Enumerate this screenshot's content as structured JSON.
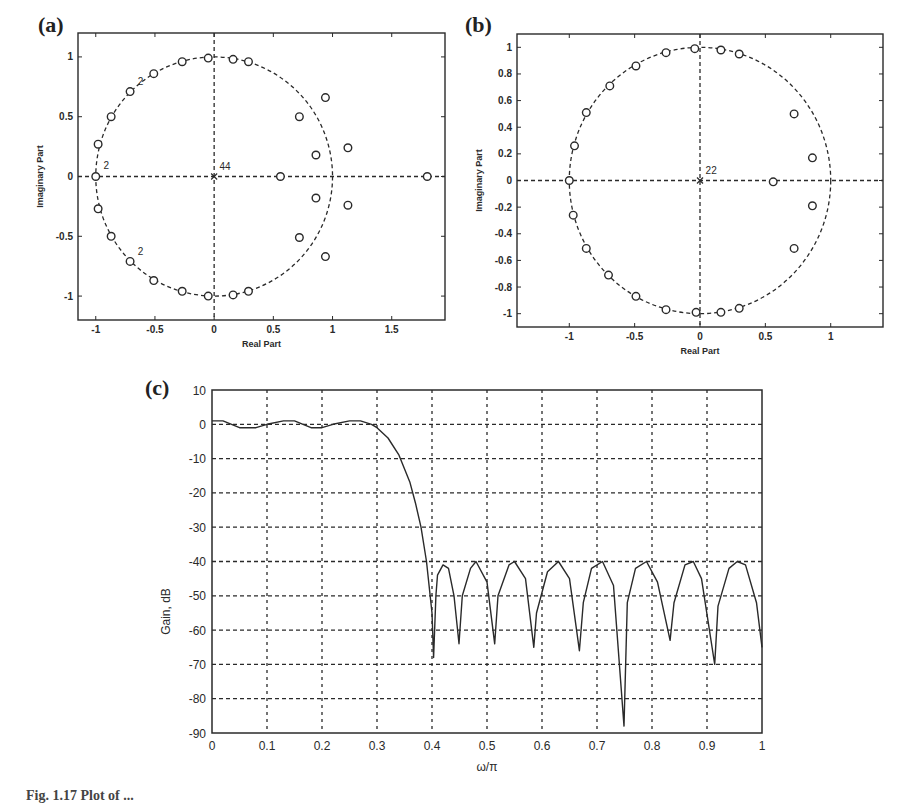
{
  "figure": {
    "caption": "Fig. 1.17  Plot of ...",
    "panels": [
      "(a)",
      "(b)",
      "(c)"
    ]
  },
  "chart_data": [
    {
      "id": "a",
      "panel_label": "(a)",
      "type": "scatter",
      "title": "",
      "xlabel": "Real Part",
      "ylabel": "Imaginary Part",
      "xlim": [
        -1.15,
        1.95
      ],
      "ylim": [
        -1.2,
        1.2
      ],
      "xticks": [
        -1,
        -0.5,
        0,
        0.5,
        1,
        1.5
      ],
      "xtick_labels": [
        "-1",
        "-0.5",
        "0",
        "0.5",
        "1",
        "1.5"
      ],
      "yticks": [
        -1,
        -0.5,
        0,
        0.5,
        1
      ],
      "ytick_labels": [
        "-1",
        "-0.5",
        "0",
        "0.5",
        "1"
      ],
      "grid": "dashed axes through origin",
      "unit_circle": true,
      "annotations": [
        {
          "text": "44",
          "x": 0.02,
          "y": 0.03
        },
        {
          "text": "2",
          "x": -0.96,
          "y": 0.04
        },
        {
          "text": "2",
          "x": -0.67,
          "y": 0.74
        },
        {
          "text": "2",
          "x": -0.67,
          "y": -0.68
        }
      ],
      "series": [
        {
          "name": "zeros",
          "marker": "o",
          "points": [
            [
              -0.05,
              0.99
            ],
            [
              0.16,
              0.98
            ],
            [
              0.29,
              0.96
            ],
            [
              -0.27,
              0.96
            ],
            [
              -0.51,
              0.86
            ],
            [
              -0.71,
              0.71
            ],
            [
              -0.87,
              0.5
            ],
            [
              -0.98,
              0.27
            ],
            [
              -1.0,
              0.0
            ],
            [
              -0.98,
              -0.27
            ],
            [
              -0.87,
              -0.5
            ],
            [
              -0.71,
              -0.71
            ],
            [
              -0.51,
              -0.87
            ],
            [
              -0.27,
              -0.96
            ],
            [
              -0.05,
              -1.0
            ],
            [
              0.16,
              -0.99
            ],
            [
              0.29,
              -0.96
            ],
            [
              0.72,
              0.5
            ],
            [
              0.94,
              0.66
            ],
            [
              0.86,
              0.18
            ],
            [
              1.13,
              0.24
            ],
            [
              0.56,
              0.0
            ],
            [
              1.8,
              0.0
            ],
            [
              0.86,
              -0.18
            ],
            [
              1.13,
              -0.24
            ],
            [
              0.72,
              -0.51
            ],
            [
              0.94,
              -0.67
            ]
          ]
        },
        {
          "name": "poles",
          "marker": "x",
          "points": [
            [
              0.0,
              0.0
            ]
          ]
        }
      ]
    },
    {
      "id": "b",
      "panel_label": "(b)",
      "type": "scatter",
      "title": "",
      "xlabel": "Real Part",
      "ylabel": "Imaginary Part",
      "xlim": [
        -1.4,
        1.4
      ],
      "ylim": [
        -1.1,
        1.1
      ],
      "xticks": [
        -1,
        -0.5,
        0,
        0.5,
        1
      ],
      "xtick_labels": [
        "-1",
        "-0.5",
        "0",
        "0.5",
        "1"
      ],
      "yticks": [
        -1,
        -0.8,
        -0.6,
        -0.4,
        -0.2,
        0,
        0.2,
        0.4,
        0.6,
        0.8,
        1
      ],
      "ytick_labels": [
        "-1",
        "-0.8",
        "-0.6",
        "-0.4",
        "-0.2",
        "0",
        "0.2",
        "0.4",
        "0.6",
        "0.8",
        "1"
      ],
      "grid": "dashed axes through origin",
      "unit_circle": true,
      "annotations": [
        {
          "text": "22",
          "x": 0.02,
          "y": 0.03
        }
      ],
      "series": [
        {
          "name": "zeros",
          "marker": "o",
          "points": [
            [
              -0.04,
              0.99
            ],
            [
              0.16,
              0.98
            ],
            [
              0.3,
              0.95
            ],
            [
              -0.26,
              0.96
            ],
            [
              -0.49,
              0.86
            ],
            [
              -0.69,
              0.71
            ],
            [
              -0.87,
              0.51
            ],
            [
              -0.96,
              0.26
            ],
            [
              -1.0,
              0.0
            ],
            [
              -0.97,
              -0.26
            ],
            [
              -0.87,
              -0.51
            ],
            [
              -0.7,
              -0.71
            ],
            [
              -0.49,
              -0.87
            ],
            [
              -0.26,
              -0.97
            ],
            [
              -0.03,
              -0.99
            ],
            [
              0.16,
              -0.99
            ],
            [
              0.3,
              -0.96
            ],
            [
              0.72,
              0.5
            ],
            [
              0.86,
              0.17
            ],
            [
              0.56,
              -0.01
            ],
            [
              0.86,
              -0.19
            ],
            [
              0.72,
              -0.51
            ]
          ]
        },
        {
          "name": "poles",
          "marker": "x",
          "points": [
            [
              0.0,
              0.0
            ]
          ]
        }
      ]
    },
    {
      "id": "c",
      "panel_label": "(c)",
      "type": "line",
      "title": "",
      "xlabel": "ω/π",
      "ylabel": "Gain, dB",
      "xlim": [
        0,
        1
      ],
      "ylim": [
        -90,
        10
      ],
      "xticks": [
        0,
        0.1,
        0.2,
        0.3,
        0.4,
        0.5,
        0.6,
        0.7,
        0.8,
        0.9,
        1
      ],
      "xtick_labels": [
        "0",
        "0.1",
        "0.2",
        "0.3",
        "0.4",
        "0.5",
        "0.6",
        "0.7",
        "0.8",
        "0.9",
        "1"
      ],
      "yticks": [
        10,
        0,
        -10,
        -20,
        -30,
        -40,
        -50,
        -60,
        -70,
        -80,
        -90
      ],
      "ytick_labels": [
        "10",
        "0",
        "-10",
        "-20",
        "-30",
        "-40",
        "-50",
        "-60",
        "-70",
        "-80",
        "-90"
      ],
      "grid": true,
      "series": [
        {
          "name": "Gain response",
          "x": [
            0,
            0.02,
            0.05,
            0.08,
            0.1,
            0.13,
            0.15,
            0.18,
            0.2,
            0.22,
            0.25,
            0.27,
            0.29,
            0.3,
            0.32,
            0.34,
            0.36,
            0.37,
            0.38,
            0.39,
            0.4,
            0.403,
            0.407,
            0.41,
            0.42,
            0.43,
            0.44,
            0.449,
            0.455,
            0.47,
            0.48,
            0.5,
            0.514,
            0.52,
            0.54,
            0.55,
            0.57,
            0.585,
            0.59,
            0.61,
            0.63,
            0.65,
            0.668,
            0.675,
            0.69,
            0.71,
            0.73,
            0.749,
            0.755,
            0.77,
            0.79,
            0.81,
            0.833,
            0.84,
            0.86,
            0.875,
            0.89,
            0.914,
            0.92,
            0.94,
            0.955,
            0.97,
            0.99,
            1.0
          ],
          "y": [
            1,
            1,
            -1,
            -1,
            0,
            1,
            1,
            -1,
            -1,
            0,
            1,
            1,
            0,
            -1,
            -4,
            -9,
            -17,
            -23,
            -30,
            -40,
            -55,
            -68,
            -50,
            -44,
            -41,
            -42,
            -50,
            -64,
            -50,
            -42,
            -40,
            -46,
            -64,
            -50,
            -41,
            -40,
            -45,
            -65,
            -55,
            -43,
            -40,
            -45,
            -66,
            -52,
            -42,
            -40,
            -47,
            -88,
            -52,
            -42,
            -40,
            -46,
            -63,
            -52,
            -41,
            -40,
            -45,
            -70,
            -53,
            -42,
            -40,
            -41,
            -52,
            -65
          ]
        }
      ]
    }
  ]
}
